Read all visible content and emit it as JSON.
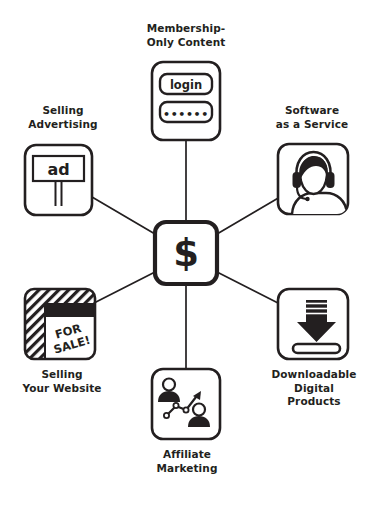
{
  "diagram": {
    "title_present": false,
    "hub": {
      "name": "money-hub",
      "symbol": "$"
    },
    "colors": {
      "stroke": "#231f20",
      "background": "#ffffff",
      "fill_dark": "#231f20",
      "text": "#231f20"
    },
    "nodes": [
      {
        "id": "membership",
        "label": "Membership-\nOnly Content",
        "icon": "login-form-icon",
        "fields": {
          "username_value": "login",
          "password_value": "••••••"
        }
      },
      {
        "id": "selling-advertising",
        "label": "Selling\nAdvertising",
        "icon": "billboard-ad-icon",
        "billboard_text": "ad"
      },
      {
        "id": "software-as-a-service",
        "label": "Software\nas a Service",
        "icon": "headset-person-icon"
      },
      {
        "id": "selling-your-website",
        "label": "Selling\nYour Website",
        "icon": "for-sale-window-icon",
        "sign_text": "FOR\nSALE!"
      },
      {
        "id": "downloadable-digital-products",
        "label": "Downloadable\nDigital\nProducts",
        "icon": "download-arrow-icon"
      },
      {
        "id": "affiliate-marketing",
        "label": "Affiliate\nMarketing",
        "icon": "two-people-growth-chart-icon"
      }
    ],
    "connections": [
      {
        "from": "money-hub",
        "to": "membership"
      },
      {
        "from": "money-hub",
        "to": "selling-advertising"
      },
      {
        "from": "money-hub",
        "to": "software-as-a-service"
      },
      {
        "from": "money-hub",
        "to": "selling-your-website"
      },
      {
        "from": "money-hub",
        "to": "downloadable-digital-products"
      },
      {
        "from": "money-hub",
        "to": "affiliate-marketing"
      }
    ]
  }
}
